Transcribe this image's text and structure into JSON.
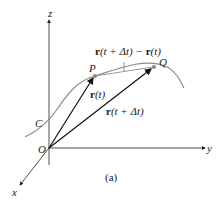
{
  "diagram": {
    "caption": "(a)",
    "axes": {
      "x": "x",
      "y": "y",
      "z": "z"
    },
    "origin": "O",
    "curve_label": "C",
    "points": {
      "P": "P",
      "Q": "Q"
    },
    "vectors": {
      "r_t": {
        "bold": "r",
        "rest": "(t)"
      },
      "r_t_dt": {
        "bold": "r",
        "rest": "(t + Δt)"
      },
      "difference": {
        "bold1": "r",
        "mid": "(t + Δt) − ",
        "bold2": "r",
        "rest": "(t)"
      }
    },
    "colors": {
      "curve": "#8a8a8a",
      "vector": "#111111",
      "chord": "#9a9a9a",
      "axis": "#222222"
    }
  }
}
